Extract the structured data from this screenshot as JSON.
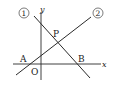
{
  "diagram": {
    "type": "coordinate-geometry",
    "colors": {
      "stroke": "#2a2a2a",
      "text": "#222222",
      "background": "#ffffff"
    },
    "axes": {
      "x_label": "x",
      "y_label": "y",
      "origin_label": "O"
    },
    "lines": [
      {
        "id": "line-1",
        "label": "①",
        "slope": "negative",
        "x1": 34,
        "y1": 16,
        "x2": 90,
        "y2": 78
      },
      {
        "id": "line-2",
        "label": "②",
        "slope": "positive",
        "x1": 16,
        "y1": 75,
        "x2": 91,
        "y2": 17
      }
    ],
    "points": [
      {
        "id": "P",
        "label": "P",
        "description": "intersection of line ① and line ②"
      },
      {
        "id": "A",
        "label": "A",
        "description": "line ② meets x-axis"
      },
      {
        "id": "B",
        "label": "B",
        "description": "line ① meets x-axis"
      }
    ]
  }
}
